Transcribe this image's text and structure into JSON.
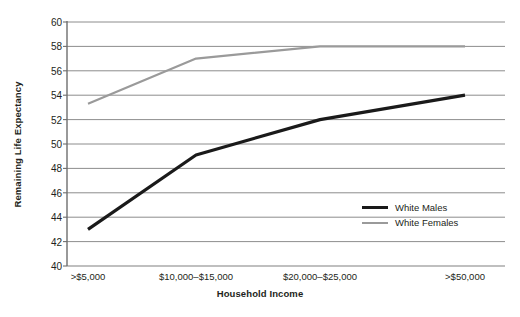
{
  "chart_data": {
    "type": "line",
    "title": "",
    "xlabel": "Household Income",
    "ylabel": "Remaining Life Expectancy",
    "categories": [
      ">$5,000",
      "$10,000–$15,000",
      "$20,000–$25,000",
      ">$50,000"
    ],
    "yticks": [
      40,
      42,
      44,
      46,
      48,
      50,
      52,
      54,
      56,
      58,
      60
    ],
    "ylim": [
      40,
      60
    ],
    "grid": true,
    "legend_position": "inside-right",
    "series": [
      {
        "name": "White Males",
        "color": "#1a1a1a",
        "width": 3.2,
        "values": [
          43.0,
          49.1,
          52.0,
          54.0
        ]
      },
      {
        "name": "White Females",
        "color": "#9a9a9a",
        "width": 2.2,
        "values": [
          53.3,
          57.0,
          58.0,
          58.0
        ]
      }
    ]
  },
  "axes": {
    "ylabel": "Remaining Life Expectancy",
    "xlabel": "Household Income",
    "ytick_labels": [
      "60",
      "58",
      "56",
      "54",
      "52",
      "50",
      "48",
      "46",
      "44",
      "42",
      "40"
    ],
    "xtick_labels": [
      ">$5,000",
      "$10,000–$15,000",
      "$20,000–$25,000",
      ">$50,000"
    ]
  },
  "legend": {
    "items": [
      {
        "label": "White Males",
        "color": "#1a1a1a"
      },
      {
        "label": "White Females",
        "color": "#9a9a9a"
      }
    ]
  },
  "style": {
    "grid_color": "#808080",
    "axis_color": "#6e6e6e",
    "background": "#ffffff",
    "text_color": "#231f20"
  }
}
